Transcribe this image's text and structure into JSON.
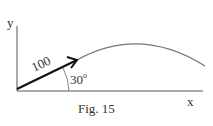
{
  "figure": {
    "caption": "Fig. 15",
    "y_axis_label": "y",
    "x_axis_label": "x",
    "velocity_label": "100",
    "angle_label": "30",
    "angle_unit": "o",
    "colors": {
      "axes": "#555555",
      "arrow": "#111111",
      "trajectory": "#777777",
      "text": "#333333"
    }
  }
}
